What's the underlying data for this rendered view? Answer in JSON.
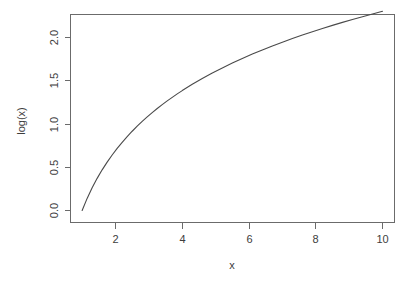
{
  "chart_data": {
    "type": "line",
    "title": "",
    "xlabel": "x",
    "ylabel": "log(x)",
    "xlim": [
      1,
      10
    ],
    "ylim": [
      0,
      2.302585
    ],
    "grid": false,
    "legend": null,
    "xticks": [
      2,
      4,
      6,
      8,
      10
    ],
    "xtick_labels": [
      "2",
      "4",
      "6",
      "8",
      "10"
    ],
    "yticks": [
      0.0,
      0.5,
      1.0,
      1.5,
      2.0
    ],
    "ytick_labels": [
      "0.0",
      "0.5",
      "1.0",
      "1.5",
      "2.0"
    ],
    "line_color": "#4a4a4a",
    "axis_color": "#6b6b6b",
    "background_color": "#ffffff",
    "series": [
      {
        "name": "log(x)",
        "x": [
          1.0,
          1.15,
          1.3,
          1.45,
          1.6,
          1.75,
          1.9,
          2.05,
          2.2,
          2.35,
          2.5,
          2.65,
          2.8,
          2.95,
          3.1,
          3.25,
          3.4,
          3.55,
          3.7,
          3.85,
          4.0,
          4.3,
          4.6,
          4.9,
          5.2,
          5.5,
          5.8,
          6.1,
          6.4,
          6.7,
          7.0,
          7.3,
          7.6,
          7.9,
          8.2,
          8.5,
          8.8,
          9.1,
          9.4,
          9.7,
          10.0
        ],
        "y": [
          0.0,
          0.1398,
          0.2624,
          0.3716,
          0.47,
          0.5596,
          0.6419,
          0.7178,
          0.7885,
          0.8544,
          0.9163,
          0.9746,
          1.0296,
          1.0818,
          1.1314,
          1.1787,
          1.2238,
          1.2669,
          1.3083,
          1.3481,
          1.3863,
          1.4586,
          1.526,
          1.5892,
          1.6487,
          1.7047,
          1.7579,
          1.8083,
          1.8563,
          1.9021,
          1.9459,
          1.9879,
          2.0281,
          2.0669,
          2.1041,
          2.1401,
          2.1748,
          2.2083,
          2.2407,
          2.2721,
          2.3026
        ]
      }
    ]
  },
  "axis": {
    "x_title": "x",
    "y_title": "log(x)"
  }
}
